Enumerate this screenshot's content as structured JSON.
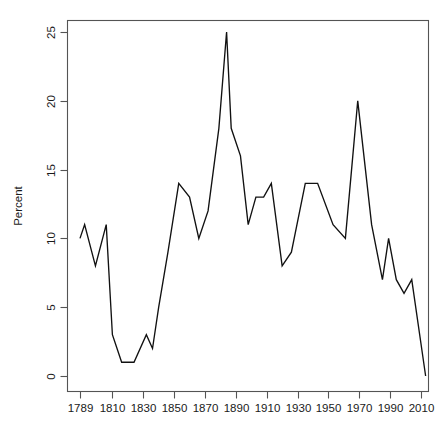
{
  "chart_data": {
    "type": "line",
    "title": "",
    "subtitle": "",
    "xlabel": "",
    "ylabel": "Percent",
    "xlim": [
      1789,
      2013
    ],
    "ylim": [
      0,
      25
    ],
    "grid": false,
    "legend": "none",
    "x_ticks": [
      1789,
      1810,
      1830,
      1850,
      1870,
      1890,
      1910,
      1930,
      1950,
      1970,
      1990,
      2010
    ],
    "x_tick_labels": [
      "1789",
      "1810",
      "1830",
      "1850",
      "1870",
      "1890",
      "1910",
      "1930",
      "1950",
      "1970",
      "1990",
      "2010"
    ],
    "y_ticks": [
      0,
      5,
      10,
      15,
      20,
      25
    ],
    "y_tick_labels": [
      "0",
      "5",
      "10",
      "15",
      "20",
      "25"
    ],
    "series": [
      {
        "name": "Percent",
        "x": [
          1789,
          1792,
          1799,
          1806,
          1810,
          1816,
          1824,
          1832,
          1836,
          1840,
          1846,
          1853,
          1860,
          1866,
          1872,
          1879,
          1884,
          1887,
          1893,
          1898,
          1903,
          1908,
          1913,
          1920,
          1926,
          1935,
          1943,
          1953,
          1961,
          1965,
          1969,
          1978,
          1985,
          1989,
          1994,
          1999,
          2004,
          2013
        ],
        "y": [
          10,
          11,
          8,
          11,
          3,
          1,
          1,
          3,
          2,
          5,
          9,
          14,
          13,
          10,
          12,
          18,
          25,
          18,
          16,
          11,
          13,
          13,
          14,
          8,
          9,
          14,
          14,
          11,
          10,
          15,
          20,
          11,
          7,
          10,
          7,
          6,
          7,
          0
        ],
        "color": "#111111"
      }
    ]
  },
  "axes": {
    "y_axis_title": "Percent"
  }
}
